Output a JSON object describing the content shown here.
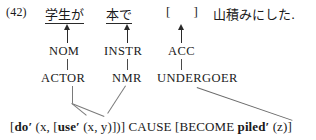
{
  "example": {
    "number": "(42)"
  },
  "sentence": {
    "np1": "学生が",
    "np2": "本で",
    "gap": "[     ]",
    "predicate": "山積みにした."
  },
  "case_markers": {
    "nom": "NOM",
    "instr": "INSTR",
    "acc": "ACC"
  },
  "macroroles": {
    "actor": "ACTOR",
    "nmr": "NMR",
    "undergoer": "UNDERGOER"
  },
  "logical_structure": {
    "open_bracket": "[",
    "do_pred": "do",
    "do_prime": "′",
    "do_args_open": " (x, [",
    "use_pred": "use",
    "use_prime": "′",
    "use_args": " (x, y)])]",
    "cause": " CAUSE ",
    "become_open": "[BECOME ",
    "piled_pred": "piled",
    "piled_prime": "′",
    "piled_args": " (z)]"
  },
  "colors": {
    "background": "#ffffff",
    "text": "#1a1a1a",
    "connector": "#7a7a7a",
    "arrow": "#2a2a2a"
  }
}
